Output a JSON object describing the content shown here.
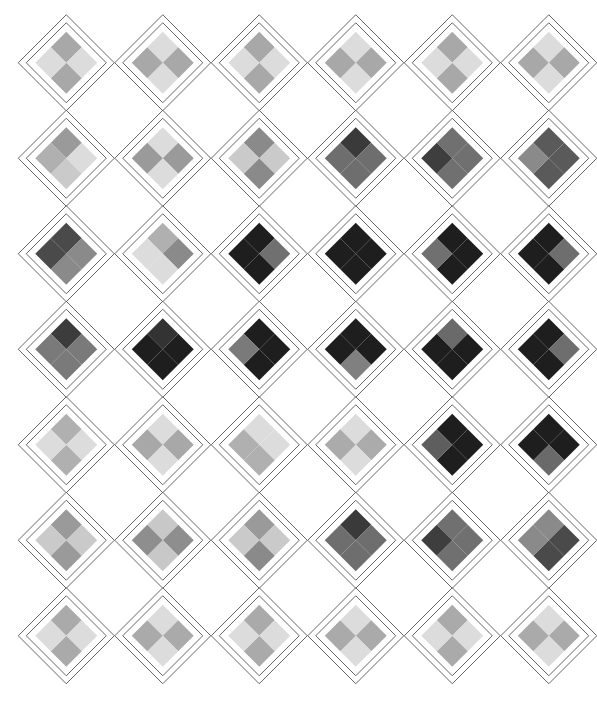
{
  "artwork": {
    "title": "Argyle Plaid Pattern",
    "type": "geometric-tiling",
    "background_color": "#ffffff",
    "outline_color": "#555555",
    "outline_width": 0.9,
    "canvas": {
      "width": 597,
      "height": 707
    },
    "grid": {
      "columns": 6,
      "rows": 7,
      "cell_width": 96.5,
      "cell_height": 95.5,
      "origin_x": 18,
      "origin_y": 15,
      "motif": "nested-diamond-with-2x2-checker",
      "outer_diamond_half": 48,
      "mid_diamond_half": 40,
      "inner_diamond_half": 31
    },
    "palette": {
      "light": "#dcdcdc",
      "light_mid": "#cacaca",
      "mid_light": "#b0b0b0",
      "mid": "#a8a8a8",
      "mid_gray": "#9a9a9a",
      "gray": "#8a8a8a",
      "dark_gray": "#707070",
      "dark_mid": "#6a6a6a",
      "dark": "#4a4a4a",
      "darker": "#3a3a3a",
      "very_dark": "#1e1e1e"
    },
    "cells": [
      [
        {
          "top": "#a8a8a8",
          "left": "#dcdcdc",
          "right": "#dcdcdc",
          "bottom": "#a8a8a8"
        },
        {
          "top": "#dcdcdc",
          "left": "#a8a8a8",
          "right": "#a8a8a8",
          "bottom": "#dcdcdc"
        },
        {
          "top": "#a8a8a8",
          "left": "#dcdcdc",
          "right": "#dcdcdc",
          "bottom": "#a8a8a8"
        },
        {
          "top": "#dcdcdc",
          "left": "#a8a8a8",
          "right": "#a8a8a8",
          "bottom": "#dcdcdc"
        },
        {
          "top": "#a8a8a8",
          "left": "#dcdcdc",
          "right": "#dcdcdc",
          "bottom": "#a8a8a8"
        },
        {
          "top": "#dcdcdc",
          "left": "#a8a8a8",
          "right": "#a8a8a8",
          "bottom": "#dcdcdc"
        }
      ],
      [
        {
          "top": "#9a9a9a",
          "left": "#b0b0b0",
          "right": "#dcdcdc",
          "bottom": "#cacaca"
        },
        {
          "top": "#dcdcdc",
          "left": "#9a9a9a",
          "right": "#9a9a9a",
          "bottom": "#dcdcdc"
        },
        {
          "top": "#8a8a8a",
          "left": "#cacaca",
          "right": "#cacaca",
          "bottom": "#8a8a8a"
        },
        {
          "top": "#3a3a3a",
          "left": "#6e6e6e",
          "right": "#6e6e6e",
          "bottom": "#6e6e6e"
        },
        {
          "top": "#707070",
          "left": "#3e3e3e",
          "right": "#707070",
          "bottom": "#707070"
        },
        {
          "top": "#5a5a5a",
          "left": "#8a8a8a",
          "right": "#5a5a5a",
          "bottom": "#5a5a5a"
        }
      ],
      [
        {
          "top": "#4a4a4a",
          "left": "#4a4a4a",
          "right": "#8a8a8a",
          "bottom": "#8a8a8a"
        },
        {
          "top": "#b0b0b0",
          "left": "#dcdcdc",
          "right": "#8a8a8a",
          "bottom": "#dcdcdc"
        },
        {
          "top": "#1e1e1e",
          "left": "#1e1e1e",
          "right": "#707070",
          "bottom": "#1e1e1e"
        },
        {
          "top": "#1e1e1e",
          "left": "#1e1e1e",
          "right": "#1e1e1e",
          "bottom": "#1e1e1e"
        },
        {
          "top": "#1e1e1e",
          "left": "#707070",
          "right": "#1e1e1e",
          "bottom": "#1e1e1e"
        },
        {
          "top": "#1e1e1e",
          "left": "#1e1e1e",
          "right": "#6e6e6e",
          "bottom": "#1e1e1e"
        }
      ],
      [
        {
          "top": "#3c3c3c",
          "left": "#7a7a7a",
          "right": "#7a7a7a",
          "bottom": "#7a7a7a"
        },
        {
          "top": "#333333",
          "left": "#1e1e1e",
          "right": "#1e1e1e",
          "bottom": "#1e1e1e"
        },
        {
          "top": "#1e1e1e",
          "left": "#7a7a7a",
          "right": "#1e1e1e",
          "bottom": "#1e1e1e"
        },
        {
          "top": "#1e1e1e",
          "left": "#1e1e1e",
          "right": "#1e1e1e",
          "bottom": "#808080"
        },
        {
          "top": "#6a6a6a",
          "left": "#1e1e1e",
          "right": "#1e1e1e",
          "bottom": "#1e1e1e"
        },
        {
          "top": "#1e1e1e",
          "left": "#1e1e1e",
          "right": "#6e6e6e",
          "bottom": "#1e1e1e"
        }
      ],
      [
        {
          "top": "#b0b0b0",
          "left": "#dcdcdc",
          "right": "#dcdcdc",
          "bottom": "#b0b0b0"
        },
        {
          "top": "#dcdcdc",
          "left": "#a8a8a8",
          "right": "#a8a8a8",
          "bottom": "#dcdcdc"
        },
        {
          "top": "#dcdcdc",
          "left": "#b0b0b0",
          "right": "#dcdcdc",
          "bottom": "#b0b0b0"
        },
        {
          "top": "#dcdcdc",
          "left": "#ababab",
          "right": "#ababab",
          "bottom": "#dcdcdc"
        },
        {
          "top": "#1e1e1e",
          "left": "#5e5e5e",
          "right": "#1e1e1e",
          "bottom": "#1e1e1e"
        },
        {
          "top": "#1e1e1e",
          "left": "#1e1e1e",
          "right": "#1e1e1e",
          "bottom": "#6a6a6a"
        }
      ],
      [
        {
          "top": "#9a9a9a",
          "left": "#cacaca",
          "right": "#cacaca",
          "bottom": "#9a9a9a"
        },
        {
          "top": "#c8c8c8",
          "left": "#8e8e8e",
          "right": "#8e8e8e",
          "bottom": "#c8c8c8"
        },
        {
          "top": "#9a9a9a",
          "left": "#cacaca",
          "right": "#cacaca",
          "bottom": "#8a8a8a"
        },
        {
          "top": "#3a3a3a",
          "left": "#6e6e6e",
          "right": "#6e6e6e",
          "bottom": "#6e6e6e"
        },
        {
          "top": "#707070",
          "left": "#3e3e3e",
          "right": "#707070",
          "bottom": "#707070"
        },
        {
          "top": "#8a8a8a",
          "left": "#8a8a8a",
          "right": "#4a4a4a",
          "bottom": "#4a4a4a"
        }
      ],
      [
        {
          "top": "#aaaaaa",
          "left": "#dcdcdc",
          "right": "#dcdcdc",
          "bottom": "#aaaaaa"
        },
        {
          "top": "#dcdcdc",
          "left": "#aaaaaa",
          "right": "#aaaaaa",
          "bottom": "#dcdcdc"
        },
        {
          "top": "#aaaaaa",
          "left": "#dcdcdc",
          "right": "#dcdcdc",
          "bottom": "#aaaaaa"
        },
        {
          "top": "#dcdcdc",
          "left": "#aaaaaa",
          "right": "#aaaaaa",
          "bottom": "#dcdcdc"
        },
        {
          "top": "#aaaaaa",
          "left": "#dcdcdc",
          "right": "#dcdcdc",
          "bottom": "#aaaaaa"
        },
        {
          "top": "#dcdcdc",
          "left": "#aaaaaa",
          "right": "#aaaaaa",
          "bottom": "#dcdcdc"
        }
      ]
    ]
  }
}
